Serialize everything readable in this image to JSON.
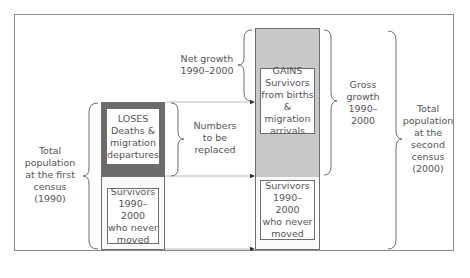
{
  "diagram": {
    "left_column": {
      "loses_box": {
        "title": "LOSES",
        "line1": "Deaths &",
        "line2": "migration",
        "line3": "departures"
      },
      "survivors_box": {
        "line1": "Survivors",
        "line2": "1990–2000",
        "line3": "who never",
        "line4": "moved"
      }
    },
    "right_column": {
      "gains_box": {
        "title": "GAINS",
        "line1": "Survivors",
        "line2": "from births",
        "line3": "& migration",
        "line4": "arrivals"
      },
      "survivors_box": {
        "line1": "Survivors",
        "line2": "1990–2000",
        "line3": "who never",
        "line4": "moved"
      }
    },
    "labels": {
      "total_first": {
        "line1": "Total",
        "line2": "population",
        "line3": "at the first",
        "line4": "census",
        "line5": "(1990)"
      },
      "numbers_replaced": {
        "line1": "Numbers",
        "line2": "to be",
        "line3": "replaced"
      },
      "net_growth": {
        "line1": "Net growth",
        "line2": "1990–2000"
      },
      "gross_growth": {
        "line1": "Gross",
        "line2": "growth",
        "line3": "1990–2000"
      },
      "total_second": {
        "line1": "Total",
        "line2": "population",
        "line3": "at the",
        "line4": "second",
        "line5": "census",
        "line6": "(2000)"
      }
    },
    "colors": {
      "loses_fill": "#6b6b6b",
      "gains_fill": "#c8c8c8",
      "line": "#6e6e6e",
      "arrow": "#9a9a9a"
    }
  }
}
